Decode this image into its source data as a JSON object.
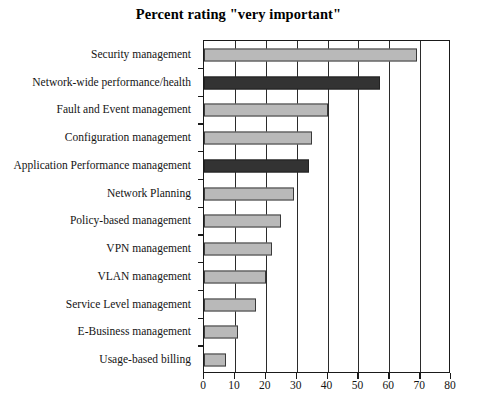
{
  "chart_data": {
    "type": "bar",
    "orientation": "horizontal",
    "title": "Percent rating \"very important\"",
    "xlabel": "",
    "ylabel": "",
    "xlim": [
      0,
      80
    ],
    "xticks": [
      0,
      10,
      20,
      30,
      40,
      50,
      60,
      70,
      80
    ],
    "grid": true,
    "grid_axis": "x",
    "legend": null,
    "categories": [
      "Security management",
      "Network-wide performance/health",
      "Fault and Event management",
      "Configuration management",
      "Application Performance management",
      "Network Planning",
      "Policy-based management",
      "VPN management",
      "VLAN management",
      "Service Level management",
      "E-Business management",
      "Usage-based billing"
    ],
    "values": [
      69,
      57,
      40,
      35,
      34,
      29,
      25,
      22,
      20,
      17,
      11,
      7
    ],
    "bar_colors": [
      "#b9b9b9",
      "#333333",
      "#b9b9b9",
      "#b9b9b9",
      "#333333",
      "#b9b9b9",
      "#b9b9b9",
      "#b9b9b9",
      "#b9b9b9",
      "#b9b9b9",
      "#b9b9b9",
      "#b9b9b9"
    ],
    "highlight_color": "#333333",
    "default_color": "#b9b9b9",
    "axis_color": "#1a1a1a"
  }
}
